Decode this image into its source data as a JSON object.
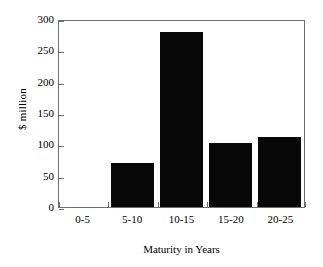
{
  "chart_data": {
    "type": "bar",
    "title": "",
    "xlabel": "Maturity in Years",
    "ylabel": "$ million",
    "categories": [
      "0-5",
      "5-10",
      "10-15",
      "15-20",
      "20-25"
    ],
    "values": [
      0,
      70,
      280,
      102,
      112
    ],
    "series": [
      {
        "name": "$ million",
        "values": [
          0,
          70,
          280,
          102,
          112
        ]
      }
    ],
    "ylim": [
      0,
      300
    ],
    "yticks": [
      0,
      50,
      100,
      150,
      200,
      250,
      300
    ],
    "ytick_labels": [
      "0",
      "50",
      "100",
      "150",
      "200",
      "250",
      "300"
    ],
    "grid": false,
    "legend": false,
    "legend_position": "none",
    "bar_color": "#080808",
    "axis_color": "#6e6e6e",
    "background_color": "#ffffff"
  }
}
